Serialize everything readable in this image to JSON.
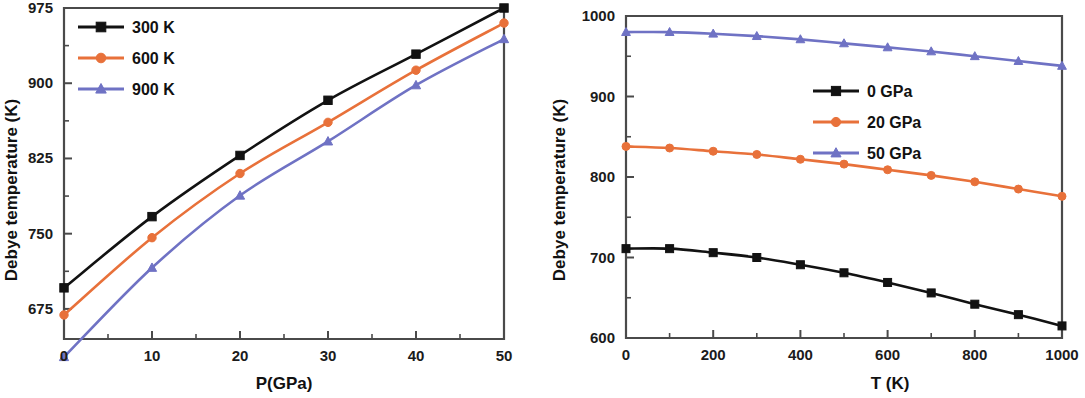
{
  "figure": {
    "background": "#ffffff",
    "panels": [
      "left",
      "right"
    ]
  },
  "colors": {
    "series_black": "#121212",
    "series_orange": "#e8713a",
    "series_blue": "#6f72c4",
    "axis": "#4a4a4a",
    "text": "#111111"
  },
  "left_panel": {
    "xlabel": "P(GPa)",
    "ylabel": "Debye temperature (K)",
    "x_ticks": [
      "0",
      "10",
      "20",
      "30",
      "40",
      "50"
    ],
    "y_ticks": [
      "675",
      "750",
      "825",
      "900",
      "975"
    ],
    "legend": [
      {
        "label": "300 K",
        "color": "#121212",
        "marker": "square"
      },
      {
        "label": "600 K",
        "color": "#e8713a",
        "marker": "circle"
      },
      {
        "label": "900 K",
        "color": "#6f72c4",
        "marker": "triangle"
      }
    ]
  },
  "right_panel": {
    "xlabel": "T (K)",
    "ylabel": "Debye temperature (K)",
    "x_ticks": [
      "0",
      "200",
      "400",
      "600",
      "800",
      "1000"
    ],
    "y_ticks": [
      "600",
      "700",
      "800",
      "900",
      "1000"
    ],
    "legend": [
      {
        "label": "0 GPa",
        "color": "#121212",
        "marker": "square"
      },
      {
        "label": "20 GPa",
        "color": "#e8713a",
        "marker": "circle"
      },
      {
        "label": "50 GPa",
        "color": "#6f72c4",
        "marker": "triangle"
      }
    ]
  },
  "chart_data": [
    {
      "type": "line",
      "panel": "left",
      "title": "",
      "xlabel": "P(GPa)",
      "ylabel": "Debye temperature (K)",
      "xlim": [
        0,
        50
      ],
      "ylim": [
        645,
        975
      ],
      "xticks": [
        0,
        10,
        20,
        30,
        40,
        50
      ],
      "yticks": [
        675,
        750,
        825,
        900,
        975
      ],
      "grid": false,
      "legend_position": "top-left",
      "x": [
        0,
        10,
        20,
        30,
        40,
        50
      ],
      "series": [
        {
          "name": "300 K",
          "color": "#121212",
          "marker": "square",
          "values": [
            696,
            767,
            828,
            883,
            929,
            975
          ]
        },
        {
          "name": "600 K",
          "color": "#e8713a",
          "marker": "circle",
          "values": [
            669,
            746,
            810,
            861,
            913,
            960
          ]
        },
        {
          "name": "900 K",
          "color": "#6f72c4",
          "marker": "triangle",
          "values": [
            627,
            716,
            788,
            842,
            898,
            944
          ]
        }
      ]
    },
    {
      "type": "line",
      "panel": "right",
      "title": "",
      "xlabel": "T (K)",
      "ylabel": "Debye temperature (K)",
      "xlim": [
        0,
        1000
      ],
      "ylim": [
        600,
        1000
      ],
      "xticks": [
        0,
        200,
        400,
        600,
        800,
        1000
      ],
      "yticks": [
        600,
        700,
        800,
        900,
        1000
      ],
      "grid": false,
      "legend_position": "right-upper",
      "x": [
        0,
        100,
        200,
        300,
        400,
        500,
        600,
        700,
        800,
        900,
        1000
      ],
      "series": [
        {
          "name": "0 GPa",
          "color": "#121212",
          "marker": "square",
          "values": [
            711,
            711,
            706,
            700,
            691,
            681,
            669,
            656,
            642,
            629,
            615
          ]
        },
        {
          "name": "20 GPa",
          "color": "#e8713a",
          "marker": "circle",
          "values": [
            838,
            836,
            832,
            828,
            822,
            816,
            809,
            802,
            794,
            785,
            776
          ]
        },
        {
          "name": "50 GPa",
          "color": "#6f72c4",
          "marker": "triangle",
          "values": [
            980,
            980,
            978,
            975,
            971,
            966,
            961,
            956,
            950,
            944,
            938
          ]
        }
      ]
    }
  ]
}
